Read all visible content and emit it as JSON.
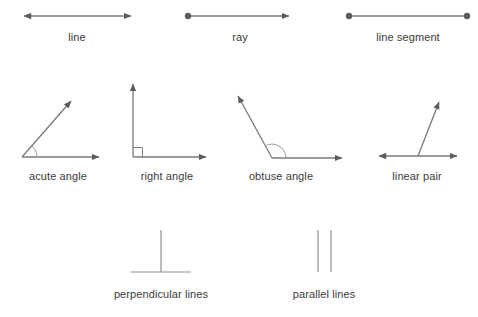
{
  "figure": {
    "background_color": "#ffffff",
    "stroke_color": "#7a7a7a",
    "marker_color": "#5c5c5c",
    "label_color": "#3b3b3b"
  },
  "rows": [
    {
      "name": "lines-row",
      "items": [
        {
          "id": "line",
          "label": "line",
          "label_x": 77,
          "label_y": 31,
          "kind": "double-arrow-line"
        },
        {
          "id": "ray",
          "label": "ray",
          "label_x": 240,
          "label_y": 31,
          "kind": "dot-to-arrow"
        },
        {
          "id": "line-segment",
          "label": "line segment",
          "label_x": 408,
          "label_y": 31,
          "kind": "dot-to-dot"
        }
      ]
    },
    {
      "name": "angles-row",
      "items": [
        {
          "id": "acute-angle",
          "label": "acute angle",
          "label_x": 58,
          "label_y": 170,
          "kind": "angle",
          "marker": "arc"
        },
        {
          "id": "right-angle",
          "label": "right angle",
          "label_x": 167,
          "label_y": 170,
          "kind": "angle",
          "marker": "square"
        },
        {
          "id": "obtuse-angle",
          "label": "obtuse angle",
          "label_x": 281,
          "label_y": 170,
          "kind": "angle",
          "marker": "arc"
        },
        {
          "id": "linear-pair",
          "label": "linear pair",
          "label_x": 417,
          "label_y": 170,
          "kind": "linear-pair",
          "marker": "none"
        }
      ]
    },
    {
      "name": "line-relationships-row",
      "items": [
        {
          "id": "perpendicular-lines",
          "label": "perpendicular lines",
          "label_x": 161,
          "label_y": 288,
          "kind": "perpendicular"
        },
        {
          "id": "parallel-lines",
          "label": "parallel lines",
          "label_x": 324,
          "label_y": 288,
          "kind": "parallel"
        }
      ]
    }
  ]
}
